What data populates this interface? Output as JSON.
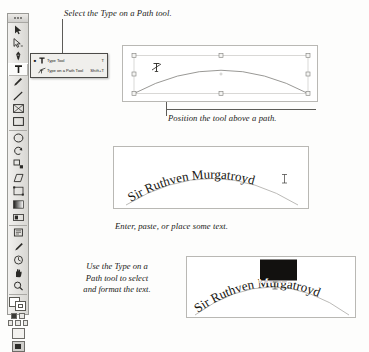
{
  "figure": {
    "background_color": "#fdfdfc"
  },
  "toolbar": {
    "name": "Tools panel",
    "selected_tool": "Type Tool",
    "tools": [
      {
        "name": "selection-tool",
        "label": "Selection Tool"
      },
      {
        "name": "direct-selection-tool",
        "label": "Direct Selection Tool"
      },
      {
        "name": "pen-tool",
        "label": "Pen Tool"
      },
      {
        "name": "type-tool",
        "label": "Type Tool",
        "selected": true
      },
      {
        "name": "pencil-tool",
        "label": "Pencil Tool"
      },
      {
        "name": "line-tool",
        "label": "Line Tool"
      },
      {
        "name": "rectangle-frame-tool",
        "label": "Rectangle Frame Tool"
      },
      {
        "name": "rectangle-tool",
        "label": "Rectangle Tool"
      },
      {
        "name": "ellipse-tool",
        "label": "Ellipse Tool"
      },
      {
        "name": "rotate-tool",
        "label": "Rotate Tool"
      },
      {
        "name": "scale-tool",
        "label": "Scale Tool"
      },
      {
        "name": "shear-tool",
        "label": "Shear Tool"
      },
      {
        "name": "free-transform-tool",
        "label": "Free Transform Tool"
      },
      {
        "name": "gradient-tool",
        "label": "Gradient Tool"
      },
      {
        "name": "gradient-feather-tool",
        "label": "Gradient Feather Tool"
      },
      {
        "name": "note-tool",
        "label": "Note Tool"
      },
      {
        "name": "eyedropper-tool",
        "label": "Eyedropper Tool"
      },
      {
        "name": "measure-tool",
        "label": "Measure Tool"
      },
      {
        "name": "hand-tool",
        "label": "Hand Tool"
      },
      {
        "name": "zoom-tool",
        "label": "Zoom Tool"
      }
    ],
    "fill_color": "#ffffff",
    "stroke_color": "#ffffff"
  },
  "flyout_menu": {
    "name": "Type tool flyout",
    "items": [
      {
        "label": "Type Tool",
        "shortcut": "T",
        "selected": true,
        "icon": "type-tool-icon"
      },
      {
        "label": "Type on a Path Tool",
        "shortcut": "Shift+T",
        "selected": false,
        "icon": "type-on-path-tool-icon"
      }
    ]
  },
  "captions": {
    "select": "Select the Type on a Path tool.",
    "position": "Position the tool above a path.",
    "enter": "Enter, paste, or place some text.",
    "format_line1": "Use the Type on a",
    "format_line2": "Path tool to select",
    "format_line3": "and format the text."
  },
  "panels": {
    "path": {
      "name": "Arc path with selection handles",
      "cursor": "type-on-path-cursor",
      "handle_count": 8
    },
    "text_on_path": {
      "name": "Text set on arc path",
      "text": "Sir Ruthven Murgatroyd",
      "cursor": "text-insertion-cursor"
    },
    "formatted": {
      "name": "Text on path with selection highlight",
      "text": "Sir Ruthven Murgatroyd",
      "selected_text": "Murgatro",
      "highlight_color": "#12110f"
    }
  }
}
